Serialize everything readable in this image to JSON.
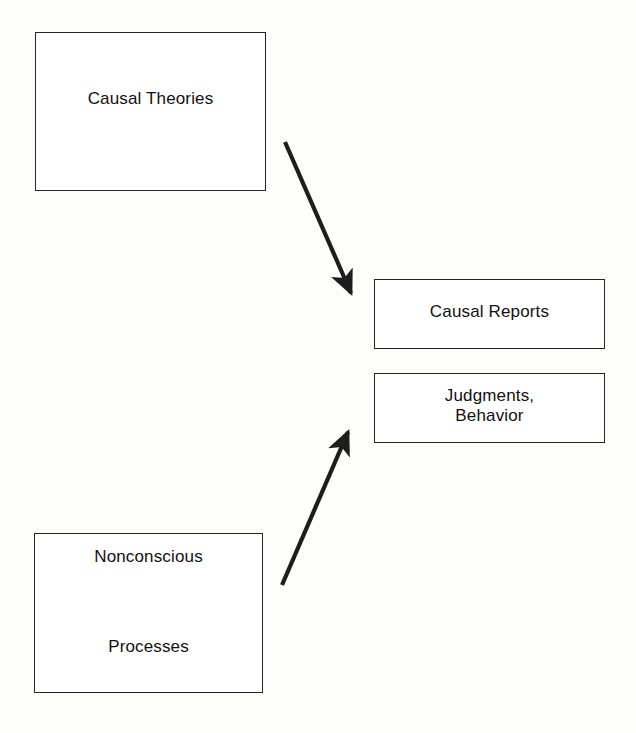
{
  "diagram": {
    "background_color": "#fdfdfc",
    "line_color": "#252525",
    "text_color": "#111111",
    "nodes": [
      {
        "id": "causal-theories",
        "label": "Causal Theories",
        "shape": "rectangle",
        "x": 35,
        "y": 32,
        "width": 231,
        "height": 159
      },
      {
        "id": "causal-reports",
        "label": "Causal Reports",
        "shape": "rectangle",
        "x": 374,
        "y": 279,
        "width": 231,
        "height": 70
      },
      {
        "id": "judgments-behavior",
        "label": "Judgments,\nBehavior",
        "shape": "rectangle",
        "x": 374,
        "y": 373,
        "width": 231,
        "height": 70
      },
      {
        "id": "nonconscious-processes",
        "label": "Nonconscious\n\nProcesses",
        "shape": "rectangle",
        "x": 34,
        "y": 533,
        "width": 229,
        "height": 160
      }
    ],
    "edges": [
      {
        "id": "theories-to-reports",
        "from": "causal-theories",
        "to": "causal-reports",
        "style": "solid-arrow",
        "x1": 285,
        "y1": 142,
        "x2": 357,
        "y2": 306
      },
      {
        "id": "nonconscious-to-judgments",
        "from": "nonconscious-processes",
        "to": "judgments-behavior",
        "style": "solid-arrow",
        "x1": 282,
        "y1": 585,
        "x2": 353,
        "y2": 419
      }
    ]
  }
}
